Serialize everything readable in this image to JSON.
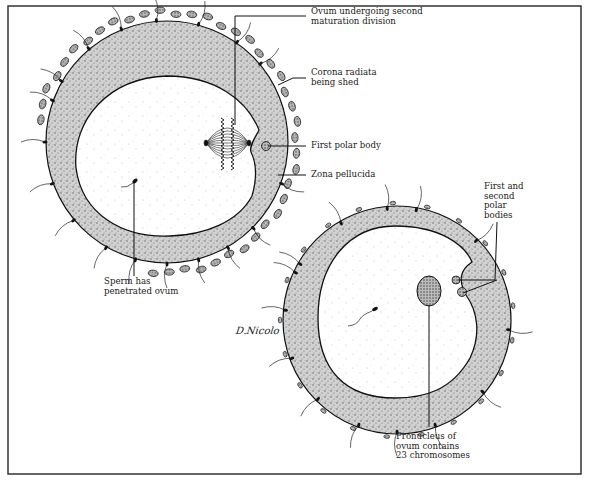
{
  "figure": {
    "colors": {
      "ink": "#1a1a1a",
      "frame": "#333333",
      "zona": "#c8c8c8",
      "cytoplasm": "#fdfdfd"
    }
  },
  "labels": {
    "ovum_division": "Ovum undergoing second\nmaturation division",
    "corona": "Corona radiata\nbeing shed",
    "first_polar": "First polar body",
    "zona_pellucida": "Zona pellucida",
    "sperm_penetrated": "Sperm has\npenetrated ovum",
    "polar_bodies": "First and\nsecond\npolar\nbodies",
    "pronucleus": "Pronucleus of\novum contains\n23 chromosomes"
  },
  "signature": "D.Nicolo",
  "cells": [
    {
      "name": "ovum-stage-1",
      "description": "Ovum with spindle, first polar body, corona radiata cells"
    },
    {
      "name": "ovum-stage-2",
      "description": "Ovum with pronucleus, first and second polar bodies, sperm inside"
    }
  ]
}
